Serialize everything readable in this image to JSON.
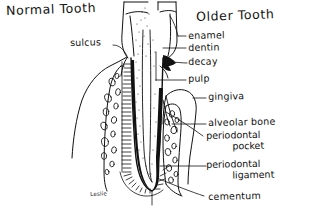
{
  "figure": {
    "kind": "hand-drawn dental cross-section diagram",
    "medium": "black ink line drawing on white paper",
    "ink_color": "#111111",
    "paper_color": "#ffffff",
    "signature": "Leslie"
  },
  "titles": {
    "left": "Normal Tooth",
    "right": "Older Tooth"
  },
  "left_labels": [
    {
      "text": "sulcus"
    }
  ],
  "right_labels": [
    {
      "text": "enamel"
    },
    {
      "text": "dentin"
    },
    {
      "text": "decay"
    },
    {
      "text": "pulp"
    },
    {
      "text": "gingiva"
    },
    {
      "text": "alveolar bone"
    }
  ],
  "right_labels_two_line": [
    {
      "line1": "periodontal",
      "line2": "pocket"
    },
    {
      "line1": "periodontal",
      "line2": "ligament"
    }
  ],
  "bottom_label": {
    "text": "cementum"
  }
}
